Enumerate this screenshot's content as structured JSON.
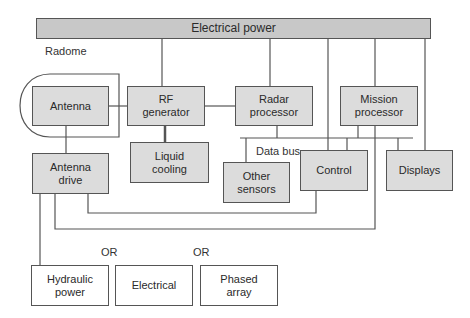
{
  "diagram": {
    "power_bar": {
      "label": "Electrical power"
    },
    "radome_label": "Radome",
    "data_bus_label": "Data bus",
    "or_labels": [
      "OR",
      "OR"
    ],
    "blocks": {
      "antenna": "Antenna",
      "rf_generator": "RF\ngenerator",
      "radar_processor": "Radar\nprocessor",
      "mission_processor": "Mission\nprocessor",
      "liquid_cooling": "Liquid\ncooling",
      "antenna_drive": "Antenna\ndrive",
      "other_sensors": "Other\nsensors",
      "control": "Control",
      "displays": "Displays"
    },
    "drive_options": {
      "hydraulic_power": "Hydraulic\npower",
      "electrical": "Electrical",
      "phased_array": "Phased\narray"
    },
    "colors": {
      "block_fill": "#dcdcdc",
      "power_fill": "#c8c8c8",
      "option_fill": "#ffffff",
      "line": "#555555"
    }
  }
}
